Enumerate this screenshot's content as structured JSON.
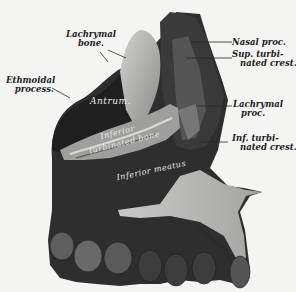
{
  "figure": {
    "colors": {
      "background": "#f4f4f2",
      "bone_dark": "#2a2a2a",
      "bone_mid": "#6e6e6e",
      "bone_light": "#b9b9b7",
      "label_text": "#1c1c1c"
    }
  },
  "labels": {
    "lachrymal_bone": {
      "line1": "Lachrymal",
      "line2": "bone."
    },
    "ethmoidal_process": {
      "line1": "Ethmoidal",
      "line2": "process."
    },
    "nasal_proc": {
      "line1": "Nasal proc."
    },
    "sup_turbinated_crest": {
      "line1": "Sup. turbi-",
      "line2": "nated crest."
    },
    "lachrymal_proc": {
      "line1": "Lachrymal",
      "line2": "proc."
    },
    "inf_turbinated_crest": {
      "line1": "Inf. turbi-",
      "line2": "nated crest."
    }
  },
  "inner_labels": {
    "antrum": "Antrum.",
    "inferior_turbinated_1": "Inferior",
    "inferior_turbinated_2": "turbinated bone",
    "inferior_meatus": "Inferior meatus"
  }
}
